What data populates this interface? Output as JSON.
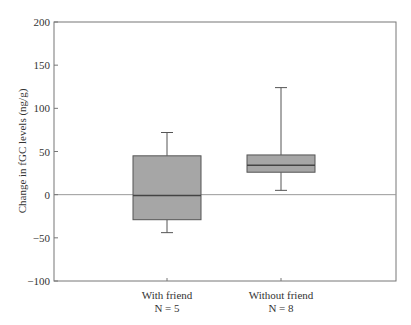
{
  "chart_data": {
    "type": "box",
    "title": "",
    "xlabel": "",
    "ylabel": "Change in fGC levels (ng/g)",
    "ylim": [
      -100,
      200
    ],
    "yticks": [
      200,
      150,
      100,
      50,
      0,
      -50,
      -100
    ],
    "grid": false,
    "reference_line": 0,
    "categories": [
      "With friend",
      "Without friend"
    ],
    "category_sublabels": [
      "N = 5",
      "N = 8"
    ],
    "series": [
      {
        "name": "With friend",
        "n": 5,
        "whisker_low": -44,
        "q1": -29,
        "median": -1,
        "q3": 45,
        "whisker_high": 72
      },
      {
        "name": "Without friend",
        "n": 8,
        "whisker_low": 5,
        "q1": 26,
        "median": 34,
        "q3": 46,
        "whisker_high": 124
      }
    ],
    "colors": {
      "box_fill": "#a6a6a6",
      "box_stroke": "#555555",
      "frame": "#777777",
      "zero_line": "#999999"
    }
  }
}
